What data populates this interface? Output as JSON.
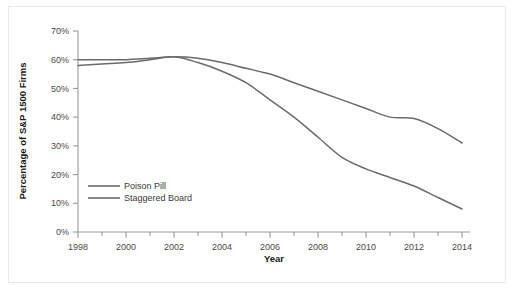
{
  "chart_data": {
    "type": "line",
    "title": "",
    "xlabel": "Year",
    "ylabel": "Percentage of S&P 1500 Firms",
    "xlim": [
      1998,
      2014
    ],
    "ylim": [
      0,
      70
    ],
    "grid": false,
    "legend_position": "inside-left",
    "x_tick_labels": [
      "1998",
      "2000",
      "2002",
      "2004",
      "2006",
      "2008",
      "2010",
      "2012",
      "2014"
    ],
    "x_tick_values": [
      1998,
      2000,
      2002,
      2004,
      2006,
      2008,
      2010,
      2012,
      2014
    ],
    "y_tick_labels": [
      "0%",
      "10%",
      "20%",
      "30%",
      "40%",
      "50%",
      "60%",
      "70%"
    ],
    "y_tick_values": [
      0,
      10,
      20,
      30,
      40,
      50,
      60,
      70
    ],
    "x": [
      1998,
      1999,
      2000,
      2001,
      2002,
      2003,
      2004,
      2005,
      2006,
      2007,
      2008,
      2009,
      2010,
      2011,
      2012,
      2013,
      2014
    ],
    "series": [
      {
        "name": "Poison Pill",
        "color": "#6b6b6b",
        "values": [
          60,
          60,
          60,
          60.5,
          61,
          60.5,
          59,
          57,
          55,
          52,
          49,
          46,
          43,
          40,
          39.5,
          36,
          31
        ]
      },
      {
        "name": "Staggered Board",
        "color": "#6b6b6b",
        "values": [
          58,
          58.5,
          59,
          60,
          61,
          59,
          56,
          52,
          46,
          40,
          33,
          26,
          22,
          19,
          16,
          12,
          8
        ]
      }
    ]
  },
  "legend": {
    "items": [
      {
        "label": "Poison Pill"
      },
      {
        "label": "Staggered Board"
      }
    ]
  },
  "axes": {
    "x_title": "Year",
    "y_title": "Percentage of S&P 1500 Firms"
  },
  "colors": {
    "line": "#6b6b6b",
    "axis": "#9a9a9a",
    "text": "#4a4a4a",
    "frame": "#e9e9e9",
    "background": "#ffffff"
  }
}
